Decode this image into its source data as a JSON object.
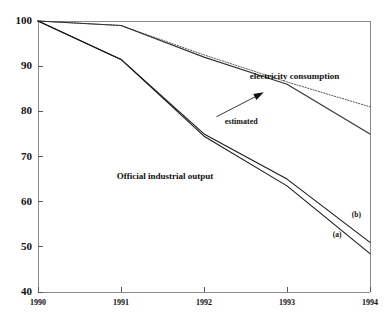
{
  "chart_data": {
    "type": "line",
    "title": "",
    "subtitle": "",
    "xlabel": "",
    "ylabel": "",
    "x": [
      1990,
      1991,
      1992,
      1993,
      1994
    ],
    "categories": [
      "1990",
      "1991",
      "1992",
      "1993",
      "1994"
    ],
    "xlim": [
      1990,
      1994
    ],
    "ylim": [
      40,
      100
    ],
    "yticks": [
      40,
      50,
      60,
      70,
      80,
      90,
      100
    ],
    "ytick_labels": [
      "40",
      "50",
      "60",
      "70",
      "80",
      "90",
      "100"
    ],
    "xticks": [
      1990,
      1991,
      1992,
      1993,
      1994
    ],
    "xtick_labels": [
      "1990",
      "1991",
      "1992",
      "1993",
      "1994"
    ],
    "grid": false,
    "legend": "none",
    "series": [
      {
        "name": "electricity consumption (estimated)",
        "style": "dotted",
        "color": "#555555",
        "values": [
          100,
          99,
          92.5,
          86.5,
          81
        ]
      },
      {
        "name": "electricity consumption",
        "style": "solid",
        "color": "#333333",
        "values": [
          100,
          99,
          92,
          86,
          75
        ]
      },
      {
        "name": "Official industrial output (b)",
        "style": "solid",
        "color": "#1a1a1a",
        "values": [
          100,
          91.5,
          75,
          65,
          51
        ]
      },
      {
        "name": "Official industrial output (a)",
        "style": "solid",
        "color": "#1a1a1a",
        "values": [
          100,
          91.5,
          74.5,
          63.5,
          48.5
        ]
      }
    ],
    "annotations": [
      {
        "text": "electricity consumption",
        "x": 1992.55,
        "y": 87.5
      },
      {
        "text": "estimated",
        "x": 1992.25,
        "y": 77.5
      },
      {
        "text": "Official industrial output",
        "x": 1990.95,
        "y": 65.5
      },
      {
        "text": "(a)",
        "x": 1993.55,
        "y": 52.5
      },
      {
        "text": "(b)",
        "x": 1993.78,
        "y": 56.8
      }
    ],
    "arrow": {
      "name": "estimated-pointer-arrow",
      "from_x": 1992.15,
      "from_y": 78.8,
      "to_x": 1992.72,
      "to_y": 84.2
    }
  }
}
